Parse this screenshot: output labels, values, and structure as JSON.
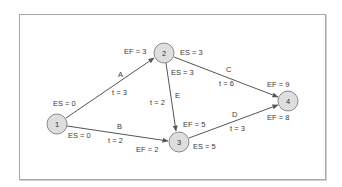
{
  "diagram": {
    "type": "activity-on-arrow network (CPM)",
    "colors": {
      "frame": "#a8a8a8",
      "arrow": "#555555",
      "node_fill": "#dedede",
      "node_stroke": "#8a8a8a",
      "text": "#3a3a3a"
    },
    "nodes": [
      {
        "id": "1",
        "label": "1",
        "cx": 57,
        "cy": 124
      },
      {
        "id": "2",
        "label": "2",
        "cx": 164,
        "cy": 53
      },
      {
        "id": "3",
        "label": "3",
        "cx": 179,
        "cy": 142
      },
      {
        "id": "4",
        "label": "4",
        "cx": 288,
        "cy": 101
      }
    ],
    "activities": [
      {
        "name": "A",
        "from": "1",
        "to": "2",
        "t": "t = 3"
      },
      {
        "name": "B",
        "from": "1",
        "to": "3",
        "t": "t = 2"
      },
      {
        "name": "C",
        "from": "2",
        "to": "4",
        "t": "t = 6"
      },
      {
        "name": "D",
        "from": "3",
        "to": "4",
        "t": "t = 3"
      },
      {
        "name": "E",
        "from": "2",
        "to": "3",
        "t": "t = 2"
      }
    ],
    "labels": {
      "a_name": "A",
      "a_time": "t = 3",
      "a_es": "ES = 0",
      "a_ef": "EF = 3",
      "b_name": "B",
      "b_time": "t = 2",
      "b_es": "ES = 0",
      "b_ef": "EF = 2",
      "c_name": "C",
      "c_time": "t = 6",
      "c_es": "ES = 3",
      "c_ef": "EF = 9",
      "d_name": "D",
      "d_time": "t = 3",
      "d_es": "ES = 5",
      "d_ef": "EF = 8",
      "e_name": "E",
      "e_time": "t = 2",
      "e_es": "ES = 3",
      "e_ef": "EF = 5"
    }
  }
}
